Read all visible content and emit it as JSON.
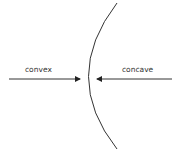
{
  "diagram": {
    "labels": {
      "left": "convex",
      "right": "concave"
    },
    "colors": {
      "stroke": "#333333",
      "background": "#ffffff"
    }
  }
}
